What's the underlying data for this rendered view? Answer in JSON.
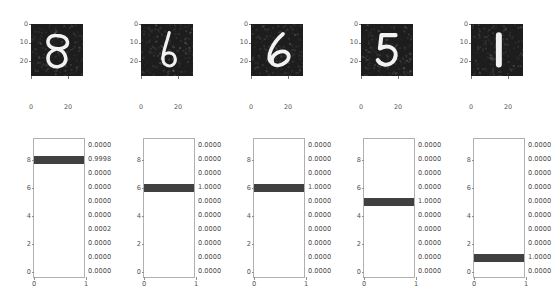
{
  "figure": {
    "background_color": "#ffffff",
    "bar_color": "#404040",
    "image_background_color": "#1d1d1d",
    "digit_stroke_color": "#f2f2f2",
    "axis_color": "#b0b0b0",
    "tick_label_color": "#545454",
    "panel_count": 5
  },
  "chart_data": {
    "type": "bar",
    "title": "",
    "xlabel": "",
    "ylabel": "",
    "orientation": "horizontal",
    "categories": [
      0,
      1,
      2,
      3,
      4,
      5,
      6,
      7,
      8,
      9
    ],
    "xlim": [
      0,
      1
    ],
    "ylim": [
      -0.5,
      9.5
    ],
    "xticks": [
      "0",
      "1"
    ],
    "yticks": [
      "0",
      "2",
      "4",
      "6",
      "8"
    ],
    "grid": false,
    "legend": "none",
    "panels": [
      {
        "name": "panel-1",
        "image": {
          "digit": "8",
          "xticks": [
            "0",
            "20"
          ],
          "yticks": [
            "0",
            "10",
            "20"
          ],
          "extent": [
            0,
            27,
            27,
            0
          ]
        },
        "values": [
          0.0,
          0.0,
          0.0,
          0.0002,
          0.0,
          0.0,
          0.0,
          0.0,
          0.9998,
          0.0
        ],
        "value_labels": [
          "0.0000",
          "0.0000",
          "0.0000",
          "0.0002",
          "0.0000",
          "0.0000",
          "0.0000",
          "0.0000",
          "0.9998",
          "0.0000"
        ],
        "predicted_class": 8,
        "predicted_probability": "0.9998"
      },
      {
        "name": "panel-2",
        "image": {
          "digit": "6",
          "xticks": [
            "0",
            "20"
          ],
          "yticks": [
            "0",
            "10",
            "20"
          ],
          "extent": [
            0,
            27,
            27,
            0
          ]
        },
        "values": [
          0.0,
          0.0,
          0.0,
          0.0,
          0.0,
          0.0,
          1.0,
          0.0,
          0.0,
          0.0
        ],
        "value_labels": [
          "0.0000",
          "0.0000",
          "0.0000",
          "0.0000",
          "0.0000",
          "0.0000",
          "1.0000",
          "0.0000",
          "0.0000",
          "0.0000"
        ],
        "predicted_class": 6,
        "predicted_probability": "1.0000"
      },
      {
        "name": "panel-3",
        "image": {
          "digit": "6",
          "xticks": [
            "0",
            "20"
          ],
          "yticks": [
            "0",
            "10",
            "20"
          ],
          "extent": [
            0,
            27,
            27,
            0
          ]
        },
        "values": [
          0.0,
          0.0,
          0.0,
          0.0,
          0.0,
          0.0,
          1.0,
          0.0,
          0.0,
          0.0
        ],
        "value_labels": [
          "0.0000",
          "0.0000",
          "0.0000",
          "0.0000",
          "0.0000",
          "0.0000",
          "1.0000",
          "0.0000",
          "0.0000",
          "0.0000"
        ],
        "predicted_class": 6,
        "predicted_probability": "1.0000"
      },
      {
        "name": "panel-4",
        "image": {
          "digit": "5",
          "xticks": [
            "0",
            "20"
          ],
          "yticks": [
            "0",
            "10",
            "20"
          ],
          "extent": [
            0,
            27,
            27,
            0
          ]
        },
        "values": [
          0.0,
          0.0,
          0.0,
          0.0,
          0.0,
          1.0,
          0.0,
          0.0,
          0.0,
          0.0
        ],
        "value_labels": [
          "0.0000",
          "0.0000",
          "0.0000",
          "0.0000",
          "0.0000",
          "1.0000",
          "0.0000",
          "0.0000",
          "0.0000",
          "0.0000"
        ],
        "predicted_class": 5,
        "predicted_probability": "1.0000"
      },
      {
        "name": "panel-5",
        "image": {
          "digit": "1",
          "xticks": [
            "0",
            "20"
          ],
          "yticks": [
            "0",
            "10",
            "20"
          ],
          "extent": [
            0,
            27,
            27,
            0
          ]
        },
        "values": [
          0.0,
          1.0,
          0.0,
          0.0,
          0.0,
          0.0,
          0.0,
          0.0,
          0.0,
          0.0
        ],
        "value_labels": [
          "0.0000",
          "1.0000",
          "0.0000",
          "0.0000",
          "0.0000",
          "0.0000",
          "0.0000",
          "0.0000",
          "0.0000",
          "0.0000"
        ],
        "predicted_class": 1,
        "predicted_probability": "1.0000"
      }
    ]
  }
}
